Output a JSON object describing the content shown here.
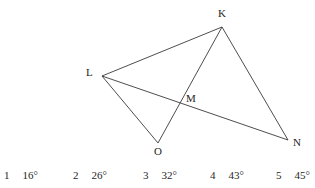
{
  "figure": {
    "type": "geometry-diagram",
    "stroke_color": "#3a3a3a",
    "background_color": "#ffffff",
    "points": [
      {
        "id": "K",
        "label": "K",
        "x": 222,
        "y": 27,
        "label_x": 218,
        "label_y": 8
      },
      {
        "id": "L",
        "label": "L",
        "x": 102,
        "y": 76,
        "label_x": 86,
        "label_y": 67
      },
      {
        "id": "M",
        "label": "M",
        "x": 181,
        "y": 103,
        "label_x": 186,
        "label_y": 93
      },
      {
        "id": "N",
        "label": "N",
        "x": 288,
        "y": 140,
        "label_x": 293,
        "label_y": 137
      },
      {
        "id": "O",
        "label": "O",
        "x": 158,
        "y": 143,
        "label_x": 154,
        "label_y": 146
      }
    ],
    "segments": [
      {
        "id": "LK",
        "from": "L",
        "to": "K"
      },
      {
        "id": "KN",
        "from": "K",
        "to": "N"
      },
      {
        "id": "LN",
        "from": "L",
        "to": "N"
      },
      {
        "id": "LO",
        "from": "L",
        "to": "O"
      },
      {
        "id": "OK",
        "from": "O",
        "to": "K"
      }
    ],
    "intersection": {
      "id": "M",
      "of": [
        "OK",
        "LN"
      ]
    }
  },
  "answers": {
    "options": [
      {
        "number": "1",
        "value": "16°",
        "x": 4
      },
      {
        "number": "2",
        "value": "26°",
        "x": 73
      },
      {
        "number": "3",
        "value": "32°",
        "x": 143
      },
      {
        "number": "4",
        "value": "43°",
        "x": 210
      },
      {
        "number": "5",
        "value": "45°",
        "x": 276
      }
    ]
  }
}
